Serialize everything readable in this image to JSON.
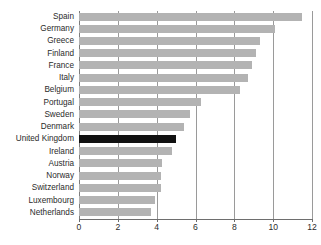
{
  "chart_data": {
    "type": "bar",
    "orientation": "horizontal",
    "title": "",
    "subtitle": "",
    "xlabel": "",
    "ylabel": "",
    "xlim": [
      0,
      12
    ],
    "xticks": [
      0,
      2,
      4,
      6,
      8,
      10,
      12
    ],
    "xtick_labels": [
      "0",
      "2",
      "4",
      "6",
      "8",
      "10",
      "12"
    ],
    "grid": true,
    "grid_axis": "x",
    "legend": false,
    "legend_position": "none",
    "categories": [
      "Spain",
      "Germany",
      "Greece",
      "Finland",
      "France",
      "Italy",
      "Belgium",
      "Portugal",
      "Sweden",
      "Denmark",
      "United Kingdom",
      "Ireland",
      "Austria",
      "Norway",
      "Switzerland",
      "Luxembourg",
      "Netherlands"
    ],
    "values": [
      11.5,
      10.1,
      9.3,
      9.1,
      8.9,
      8.7,
      8.3,
      6.3,
      5.7,
      5.4,
      5.0,
      4.8,
      4.3,
      4.2,
      4.2,
      3.9,
      3.7
    ],
    "highlight_category": "United Kingdom",
    "colors": {
      "bar": "#b3b3b3",
      "bar_highlight": "#111111",
      "gridline": "#9a9a9a",
      "axis": "#6e6e6e",
      "text": "#2b2b2b",
      "background": "#ffffff"
    }
  }
}
